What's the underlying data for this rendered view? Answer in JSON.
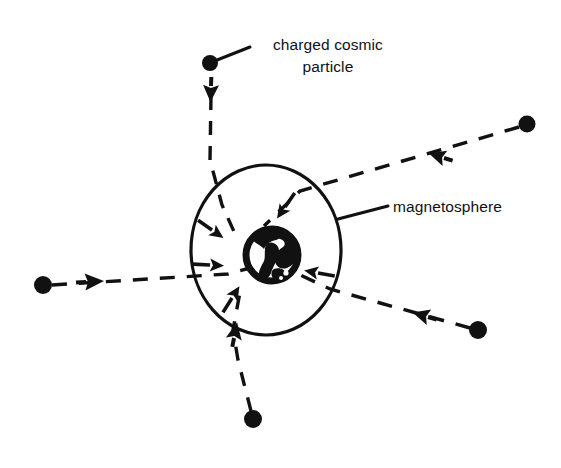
{
  "figure": {
    "background_color": "#ffffff",
    "ink_color": "#111111",
    "width": 561,
    "height": 468
  },
  "labels": {
    "particle": {
      "line1": "charged cosmic",
      "line2": "particle",
      "x": 328,
      "y": 45
    },
    "magnetosphere": {
      "text": "magnetosphere",
      "x": 393,
      "y": 212
    }
  },
  "magnetosphere_boundary": {
    "center_x": 266,
    "center_y": 250,
    "radius_x": 75,
    "radius_y": 85,
    "stroke_width": 3.2
  },
  "earth": {
    "center_x": 272,
    "center_y": 255,
    "radius": 29,
    "stroke_width": 6
  },
  "particles": [
    {
      "name": "particle-top",
      "dot_x": 210,
      "dot_y": 63,
      "dot_r": 8,
      "arrow_x": 211,
      "arrow_y": 88,
      "arrow_angle": 92,
      "path": "M 211,96 L 210,160 L 222,205 L 236,236"
    },
    {
      "name": "particle-top-right",
      "dot_x": 527,
      "dot_y": 124,
      "dot_r": 8.5,
      "arrow_x": 444,
      "arrow_y": 158,
      "arrow_angle": 202,
      "path": "M 519,127 L 300,191 L 264,226"
    },
    {
      "name": "particle-left",
      "dot_x": 43,
      "dot_y": 285,
      "dot_r": 9,
      "arrow_x": 92,
      "arrow_y": 281,
      "arrow_angle": 355,
      "path": "M 52,285 L 228,274 L 250,268"
    },
    {
      "name": "particle-bottom-right",
      "dot_x": 478,
      "dot_y": 330,
      "dot_r": 9,
      "arrow_x": 428,
      "arrow_y": 316,
      "arrow_angle": 197,
      "path": "M 470,328 L 330,289 L 292,271"
    },
    {
      "name": "particle-bottom",
      "dot_x": 253,
      "dot_y": 419,
      "dot_r": 9,
      "arrow_x": 233,
      "arrow_y": 337,
      "arrow_angle": 282,
      "path": "M 251,411 L 238,360 L 233,330 L 240,292"
    }
  ],
  "deflection_arrows": [
    {
      "name": "deflection-arrow-top",
      "x": 285,
      "y": 207,
      "angle": 125,
      "length": 26
    },
    {
      "name": "deflection-arrow-upper-left",
      "x": 214,
      "y": 228,
      "angle": 35,
      "length": 26
    },
    {
      "name": "deflection-arrow-left",
      "x": 212,
      "y": 264,
      "angle": 5,
      "length": 26
    },
    {
      "name": "deflection-arrow-lower-left",
      "x": 234,
      "y": 297,
      "angle": 300,
      "length": 26
    },
    {
      "name": "deflection-arrow-right",
      "x": 318,
      "y": 272,
      "angle": 190,
      "length": 26
    }
  ],
  "leaders": [
    {
      "name": "leader-particle",
      "path": "M 212,62 L 250,47"
    },
    {
      "name": "leader-magnetosphere",
      "path": "M 338,219 L 388,206"
    }
  ]
}
